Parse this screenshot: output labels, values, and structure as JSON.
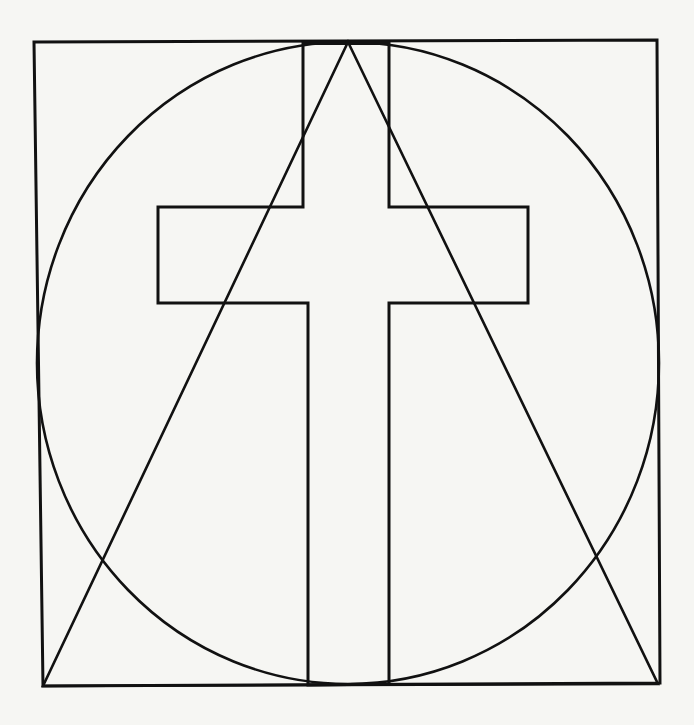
{
  "figure": {
    "title": "Geometric emblem: cross within triangle within circle within square",
    "colors": {
      "background": "#f6f6f3",
      "line": "#111111"
    },
    "shapes": {
      "square": {
        "points": [
          [
            34,
            42
          ],
          [
            657,
            40
          ],
          [
            660,
            683
          ],
          [
            43,
            686
          ]
        ]
      },
      "circle": {
        "cx": 348,
        "cy": 363,
        "rx": 311,
        "ry": 321
      },
      "triangle": {
        "points": [
          [
            348,
            42
          ],
          [
            658,
            684
          ],
          [
            43,
            686
          ]
        ]
      },
      "cross": {
        "points": [
          [
            303,
            42
          ],
          [
            389,
            42
          ],
          [
            389,
            207
          ],
          [
            528,
            207
          ],
          [
            528,
            303
          ],
          [
            389,
            303
          ],
          [
            389,
            684
          ],
          [
            308,
            685
          ],
          [
            308,
            303
          ],
          [
            158,
            303
          ],
          [
            158,
            207
          ],
          [
            303,
            207
          ]
        ]
      },
      "top_bar": {
        "x1": 303,
        "y1": 43,
        "x2": 389,
        "y2": 43
      }
    }
  }
}
